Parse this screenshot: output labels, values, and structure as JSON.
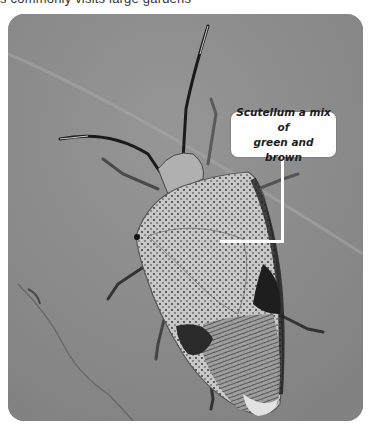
{
  "page": {
    "caption_fragment": "s commonly visits large gardens"
  },
  "photo": {
    "subject": "shield bug on leaf",
    "background_color": "#8b8b8b",
    "leaf_vein_color": "#a9a9a9",
    "bug_light_color": "#cfcfcf",
    "bug_dark_color": "#1e1e1e"
  },
  "callout": {
    "line1": "Scutellum a mix of",
    "line2": "green and brown",
    "background_color": "#ffffff",
    "text_color": "#1d1d1d"
  }
}
